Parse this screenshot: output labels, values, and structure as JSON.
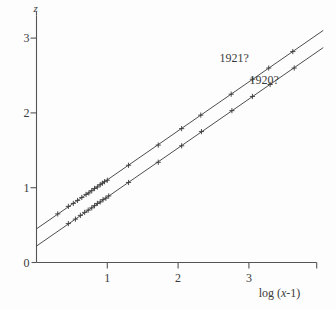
{
  "chart_data": {
    "type": "scatter",
    "title": "",
    "subtitle": "",
    "xlabel": "log (x-1)",
    "ylabel": "z",
    "xlim": [
      0,
      4.0
    ],
    "ylim": [
      0,
      3.3
    ],
    "grid": false,
    "legend_position": "inline-right",
    "x_ticks": [
      1,
      2,
      3
    ],
    "x_tick_labels": [
      "1",
      "2",
      "3"
    ],
    "y_ticks": [
      0,
      1,
      2,
      3
    ],
    "y_tick_labels": [
      "0",
      "1",
      "2",
      "3"
    ],
    "marker": "plus",
    "annotations": [
      {
        "text": "1921?",
        "x": 3.05,
        "y": 2.72
      },
      {
        "text": "1920?",
        "x": 3.32,
        "y": 2.42
      }
    ],
    "series": [
      {
        "name": "1921?",
        "label": "1921?",
        "color": "#3a3a3a",
        "fit_line": {
          "intercept": 0.45,
          "slope": 0.655,
          "x_start": 0.0,
          "x_end": 4.05
        },
        "points_x": [
          0.3,
          0.45,
          0.52,
          0.58,
          0.64,
          0.7,
          0.74,
          0.78,
          0.82,
          0.86,
          0.9,
          0.93,
          0.96,
          1.0,
          1.3,
          1.72,
          2.05,
          2.32,
          2.75,
          3.05,
          3.28,
          3.62
        ],
        "points_y": [
          0.65,
          0.75,
          0.79,
          0.83,
          0.87,
          0.91,
          0.93,
          0.96,
          0.99,
          1.01,
          1.04,
          1.06,
          1.08,
          1.1,
          1.3,
          1.57,
          1.79,
          1.97,
          2.25,
          2.45,
          2.6,
          2.82
        ]
      },
      {
        "name": "1920?",
        "label": "1920?",
        "color": "#3a3a3a",
        "fit_line": {
          "intercept": 0.22,
          "slope": 0.655,
          "x_start": 0.0,
          "x_end": 4.05
        },
        "points_x": [
          0.45,
          0.55,
          0.62,
          0.68,
          0.73,
          0.78,
          0.82,
          0.86,
          0.9,
          0.94,
          0.98,
          1.02,
          1.3,
          1.72,
          2.05,
          2.33,
          2.76,
          3.05,
          3.3,
          3.64
        ],
        "points_y": [
          0.52,
          0.58,
          0.63,
          0.67,
          0.7,
          0.73,
          0.76,
          0.79,
          0.81,
          0.84,
          0.86,
          0.89,
          1.07,
          1.34,
          1.56,
          1.75,
          2.03,
          2.22,
          2.38,
          2.6
        ]
      }
    ]
  },
  "axes": {
    "y_axis_symbol": "z",
    "x_axis_title_prefix": "log (",
    "x_axis_title_var": "x",
    "x_axis_title_suffix": "-1)"
  }
}
